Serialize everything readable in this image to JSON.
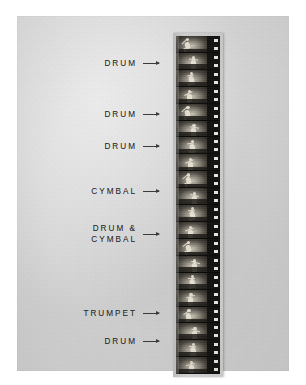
{
  "figure": {
    "medium": "photographic print of a vertical motion-picture film strip",
    "background_color": "#d6d6d6",
    "print_border_color": "#ffffff",
    "film_base_color": "#14140f",
    "label_color": "#2c2c2c"
  },
  "annotations": [
    {
      "id": "a1",
      "text": "DRUM",
      "lines": [
        "DRUM"
      ],
      "top": 42,
      "arrow_top": 47,
      "frame_index": 1
    },
    {
      "id": "a2",
      "text": "DRUM",
      "lines": [
        "DRUM"
      ],
      "top": 93,
      "arrow_top": 98,
      "frame_index": 4
    },
    {
      "id": "a3",
      "text": "DRUM",
      "lines": [
        "DRUM"
      ],
      "top": 125,
      "arrow_top": 130,
      "frame_index": 6
    },
    {
      "id": "a4",
      "text": "CYMBAL",
      "lines": [
        "CYMBAL"
      ],
      "top": 170,
      "arrow_top": 175,
      "frame_index": 9
    },
    {
      "id": "a5",
      "text": "DRUM & CYMBAL",
      "lines": [
        "DRUM &",
        "CYMBAL"
      ],
      "top": 207,
      "arrow_top": 218,
      "frame_index": 11
    },
    {
      "id": "a6",
      "text": "TRUMPET",
      "lines": [
        "TRUMPET"
      ],
      "top": 292,
      "arrow_top": 297,
      "frame_index": 16
    },
    {
      "id": "a7",
      "text": "DRUM",
      "lines": [
        "DRUM"
      ],
      "top": 320,
      "arrow_top": 325,
      "frame_index": 18
    }
  ],
  "film_strip": {
    "frame_count": 20,
    "sprocket_holes_per_frame": 2,
    "orientation": "vertical",
    "subject": "dancing figure / musician repeated across successive frames"
  }
}
